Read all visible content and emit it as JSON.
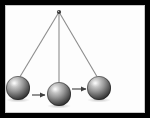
{
  "figure": {
    "alt_text": "A pendulum shown at three positions: raised at left, at the lowest point in the center, and raised at right, with arrows indicating motion to the right.",
    "frame": {
      "border_color": "#000000",
      "background_color": "#fdfdfd",
      "inner_edge_color": "#c9c9c9",
      "border_width_px": 5,
      "width_px": 150,
      "height_px": 118
    },
    "pivot": {
      "label": "pivot-point",
      "x": 59,
      "y": 12,
      "color": "#3a3a3a",
      "size_px": 4
    },
    "strings": [
      {
        "label": "string-left",
        "x1": 59,
        "y1": 12,
        "x2": 18,
        "y2": 80,
        "color": "#8d8d8d"
      },
      {
        "label": "string-center",
        "x1": 59,
        "y1": 12,
        "x2": 59,
        "y2": 86,
        "color": "#8d8d8d"
      },
      {
        "label": "string-right",
        "x1": 59,
        "y1": 12,
        "x2": 99,
        "y2": 80,
        "color": "#8d8d8d"
      }
    ],
    "bobs": [
      {
        "label": "bob-left",
        "position": "raised-left",
        "cx": 18,
        "cy": 88,
        "r": 12,
        "highlight_color": "#d8d8d8",
        "mid_color": "#8a8a8a",
        "edge_color": "#2b2b2b"
      },
      {
        "label": "bob-center",
        "position": "lowest-point",
        "cx": 59,
        "cy": 94,
        "r": 12,
        "highlight_color": "#d8d8d8",
        "mid_color": "#8a8a8a",
        "edge_color": "#2b2b2b"
      },
      {
        "label": "bob-right",
        "position": "raised-right",
        "cx": 99,
        "cy": 88,
        "r": 12,
        "highlight_color": "#d8d8d8",
        "mid_color": "#8a8a8a",
        "edge_color": "#2b2b2b"
      }
    ],
    "arrows": [
      {
        "label": "motion-arrow-left",
        "direction": "right",
        "x1": 32,
        "y1": 95,
        "x2": 45,
        "y2": 95,
        "color": "#4a4a4a"
      },
      {
        "label": "motion-arrow-right",
        "direction": "right",
        "x1": 72,
        "y1": 89,
        "x2": 86,
        "y2": 89,
        "color": "#4a4a4a"
      }
    ],
    "shadows": [
      {
        "label": "shadow-left",
        "cx": 18,
        "cy": 100,
        "rx": 12,
        "ry": 2.5,
        "color": "rgba(140,140,140,0.35)"
      },
      {
        "label": "shadow-center",
        "cx": 59,
        "cy": 106,
        "rx": 12,
        "ry": 2.5,
        "color": "rgba(140,140,140,0.35)"
      },
      {
        "label": "shadow-right",
        "cx": 99,
        "cy": 100,
        "rx": 12,
        "ry": 2.5,
        "color": "rgba(140,140,140,0.35)"
      }
    ]
  }
}
